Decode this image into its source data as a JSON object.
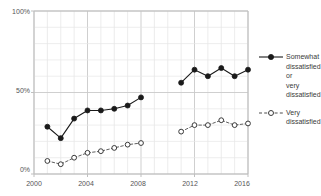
{
  "chart_data": {
    "type": "line",
    "title": "",
    "xlabel": "",
    "ylabel": "",
    "xlim": [
      2000,
      2016
    ],
    "ylim": [
      0,
      100
    ],
    "grid": true,
    "legend_position": "right",
    "y_ticks": [
      "0%",
      "50%",
      "100%"
    ],
    "y_tick_values": [
      0,
      50,
      100
    ],
    "x_ticks": [
      "2000",
      "2004",
      "2008",
      "2012",
      "2016"
    ],
    "x_tick_values": [
      2000,
      2004,
      2008,
      2012,
      2016
    ],
    "series": [
      {
        "name": "Somewhat dissatisfied or very dissatisfied",
        "marker": "filled-circle",
        "line_style": "solid",
        "color": "#1a1a1a",
        "x": [
          2001,
          2002,
          2003,
          2004,
          2005,
          2006,
          2007,
          2008,
          2011,
          2012,
          2013,
          2014,
          2015,
          2016
        ],
        "values": [
          29,
          22,
          34,
          39,
          39,
          40,
          42,
          47,
          56,
          64,
          60,
          65,
          60,
          64
        ],
        "segments": [
          {
            "x": [
              2001,
              2002,
              2003,
              2004,
              2005,
              2006,
              2007,
              2008
            ],
            "values": [
              29,
              22,
              34,
              39,
              39,
              40,
              42,
              47
            ]
          },
          {
            "x": [
              2011,
              2012,
              2013,
              2014,
              2015,
              2016
            ],
            "values": [
              56,
              64,
              60,
              65,
              60,
              64
            ]
          }
        ]
      },
      {
        "name": "Very dissatisfied",
        "marker": "open-circle",
        "line_style": "dashed",
        "color": "#4d4d4d",
        "x": [
          2001,
          2002,
          2003,
          2004,
          2005,
          2006,
          2007,
          2008,
          2011,
          2012,
          2013,
          2014,
          2015,
          2016
        ],
        "values": [
          8,
          6,
          10,
          13,
          14,
          16,
          18,
          19,
          26,
          30,
          30,
          33,
          30,
          31
        ],
        "segments": [
          {
            "x": [
              2001,
              2002,
              2003,
              2004,
              2005,
              2006,
              2007,
              2008
            ],
            "values": [
              8,
              6,
              10,
              13,
              14,
              16,
              18,
              19
            ]
          },
          {
            "x": [
              2011,
              2012,
              2013,
              2014,
              2015,
              2016
            ],
            "values": [
              26,
              30,
              30,
              33,
              30,
              31
            ]
          }
        ]
      }
    ]
  },
  "legend": {
    "entries": [
      {
        "label": "Somewhat\ndissatisfied\nor\nvery\ndissatisfied",
        "style": "solid-filled"
      },
      {
        "label": "Very\ndissatisfied",
        "style": "dashed-open"
      }
    ]
  },
  "axes": {
    "y_labels": [
      "100%",
      "50%",
      "0%"
    ],
    "x_labels": [
      "2000",
      "2004",
      "2008",
      "2012",
      "2016"
    ]
  },
  "colors": {
    "series_primary": "#1a1a1a",
    "series_secondary": "#4d4d4d",
    "grid": "#d9d9d9",
    "axis": "#bfbfbf",
    "text": "#555555",
    "background": "#ffffff"
  }
}
